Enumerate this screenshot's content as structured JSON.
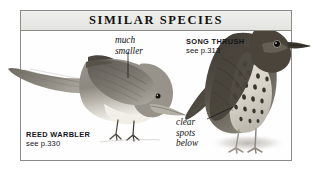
{
  "panel": {
    "title": "SIMILAR SPECIES",
    "background_color": "#ffffff",
    "frame_border_color": "#8a8a86",
    "title_bar_color": "#e8e8e5"
  },
  "species": [
    {
      "key": "reed_warbler",
      "name": "REED WARBLER",
      "page_reference": "see p.330"
    },
    {
      "key": "song_thrush",
      "name": "SONG THRUSH",
      "page_reference": "see p.313"
    }
  ],
  "annotations": [
    {
      "key": "much_smaller",
      "text": "much\nsmaller",
      "points_to": "reed_warbler"
    },
    {
      "key": "clear_spots_below",
      "text": "clear\nspots\nbelow",
      "points_to": "song_thrush"
    }
  ],
  "illustrations": [
    {
      "key": "reed_warbler_illustration",
      "subject": "reed warbler bird perched facing right with long tail"
    },
    {
      "key": "song_thrush_illustration",
      "subject": "song thrush bird standing upright facing right with spotted breast"
    }
  ]
}
